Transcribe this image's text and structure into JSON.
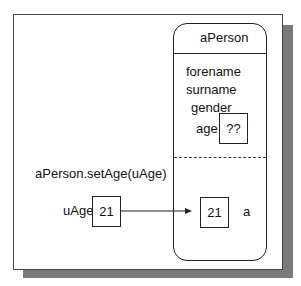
{
  "diagram": {
    "object": {
      "name": "aPerson",
      "attributes": [
        "forename",
        "surname",
        "gender",
        "age"
      ],
      "age_value": "??",
      "param_label": "a",
      "param_value": "21"
    },
    "call": {
      "text": "aPerson.setAge(uAge)",
      "var_label": "uAge",
      "var_value": "21"
    }
  }
}
